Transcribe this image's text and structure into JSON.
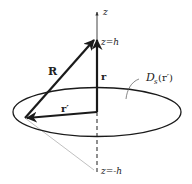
{
  "diagram": {
    "axis": {
      "label": "z",
      "top_point_label": "z=h",
      "bottom_point_label": "z=-h"
    },
    "vectors": {
      "R": "R",
      "r": "r",
      "r_prime": "r′"
    },
    "surface": {
      "label_main": "D",
      "label_sub": "s",
      "label_arg": "(r′)"
    },
    "colors": {
      "stroke": "#1a1a1a",
      "thin_line": "#b0b0b0",
      "background": "#ffffff"
    }
  }
}
